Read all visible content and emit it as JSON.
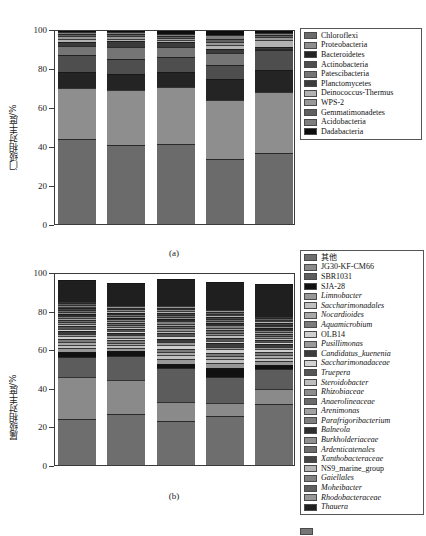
{
  "figure": {
    "panels": [
      "(a)",
      "(b)"
    ]
  },
  "chart_data": [
    {
      "type": "bar",
      "id": "panel-a",
      "stacked": true,
      "percent": true,
      "title": "",
      "caption": "(a)",
      "xlabel": "",
      "ylabel": "门级相对丰度/%",
      "ylim": [
        0,
        100
      ],
      "yticks": [
        0,
        20,
        40,
        60,
        80,
        100
      ],
      "ytick_labels": [
        "0",
        "20",
        "40",
        "60",
        "80",
        "100"
      ],
      "grid": false,
      "legend_position": "right",
      "categories": [
        "UASB-0",
        "UASB-1",
        "UASB-2",
        "UASB-3",
        "UASB-4"
      ],
      "series": [
        {
          "name": "Chloroflexi",
          "color": "#6b6b6b",
          "values": [
            43.8,
            40.6,
            41.0,
            33.5,
            36.2
          ]
        },
        {
          "name": "Proteobacteria",
          "color": "#8e8e8e",
          "values": [
            25.9,
            27.9,
            29.3,
            29.9,
            31.7
          ]
        },
        {
          "name": "Bacteroidetes",
          "color": "#242424",
          "values": [
            8.1,
            8.6,
            7.6,
            11.0,
            11.3
          ]
        },
        {
          "name": "Actinobacteria",
          "color": "#4e4e4e",
          "values": [
            9.0,
            7.6,
            8.0,
            7.2,
            9.8
          ]
        },
        {
          "name": "Patescibacteria",
          "color": "#757575",
          "values": [
            4.4,
            6.3,
            5.1,
            6.2,
            0.6
          ]
        },
        {
          "name": "Planctomycetes",
          "color": "#3b3b3b",
          "values": [
            2.3,
            2.7,
            2.1,
            2.1,
            1.4
          ]
        },
        {
          "name": "Deinococcus-Thermus",
          "color": "#b2b2b2",
          "values": [
            1.5,
            1.4,
            1.3,
            2.0,
            3.6
          ]
        },
        {
          "name": "WPS-2",
          "color": "#989898",
          "values": [
            1.2,
            1.1,
            1.0,
            1.5,
            1.1
          ]
        },
        {
          "name": "Gemmatimonadetes",
          "color": "#606060",
          "values": [
            1.1,
            1.0,
            1.1,
            1.3,
            1.2
          ]
        },
        {
          "name": "Acidobacteria",
          "color": "#7e7e7e",
          "values": [
            1.2,
            1.2,
            1.2,
            2.0,
            1.1
          ]
        },
        {
          "name": "Dadabacteria",
          "color": "#0d0d0d",
          "values": [
            1.5,
            1.6,
            2.3,
            3.3,
            2.0
          ]
        }
      ]
    },
    {
      "type": "bar",
      "id": "panel-b",
      "stacked": true,
      "percent": true,
      "title": "",
      "caption": "(b)",
      "xlabel": "",
      "ylabel": "属级相对丰度/%",
      "ylim": [
        0,
        100
      ],
      "yticks": [
        0,
        20,
        40,
        60,
        80,
        100
      ],
      "ytick_labels": [
        "0",
        "20",
        "40",
        "60",
        "80",
        "100"
      ],
      "grid": false,
      "legend_position": "right",
      "categories": [
        "UASB-0",
        "UASB-1",
        "UASB-2",
        "UASB-3",
        "UASB-4"
      ],
      "series": [
        {
          "name": "其他",
          "color": "#6e6e6e",
          "cjk": true,
          "values": [
            24.0,
            26.5,
            23.0,
            25.5,
            31.5
          ]
        },
        {
          "name": "JG30-KF-CM66",
          "color": "#8a8a8a",
          "values": [
            21.5,
            17.8,
            9.5,
            6.5,
            8.0
          ]
        },
        {
          "name": "SBR1031",
          "color": "#5c5c5c",
          "values": [
            10.5,
            12.0,
            18.0,
            13.5,
            10.5
          ]
        },
        {
          "name": "SJA-28",
          "color": "#111111",
          "values": [
            2.5,
            2.8,
            2.0,
            5.0,
            2.0
          ]
        },
        {
          "name": "Limnobacter",
          "color": "#979797",
          "italic": true,
          "values": [
            2.0,
            1.6,
            2.5,
            2.2,
            2.0
          ]
        },
        {
          "name": "Saccharimonadales",
          "color": "#c0c0c0",
          "italic": true,
          "values": [
            1.6,
            1.3,
            1.9,
            2.0,
            1.6
          ]
        },
        {
          "name": "Nocardioides",
          "color": "#a8a8a8",
          "italic": true,
          "values": [
            1.5,
            1.2,
            1.6,
            1.8,
            1.5
          ]
        },
        {
          "name": "Aquamicrobium",
          "color": "#7b7b7b",
          "italic": true,
          "values": [
            1.5,
            1.4,
            1.8,
            1.5,
            1.4
          ]
        },
        {
          "name": "OLB14",
          "color": "#cfcfcf",
          "values": [
            1.6,
            1.4,
            2.0,
            1.9,
            1.5
          ]
        },
        {
          "name": "Pusillimonas",
          "color": "#999999",
          "italic": true,
          "values": [
            1.4,
            1.3,
            1.6,
            1.5,
            1.3
          ]
        },
        {
          "name": "Candidatus_kuenenia",
          "color": "#3c3c3c",
          "italic": true,
          "values": [
            1.3,
            1.2,
            1.5,
            1.6,
            1.2
          ]
        },
        {
          "name": "Saccharimonadaceae",
          "color": "#d2d2d2",
          "italic": true,
          "values": [
            1.3,
            1.1,
            1.5,
            1.5,
            1.1
          ]
        },
        {
          "name": "Truepera",
          "color": "#555555",
          "italic": true,
          "values": [
            1.2,
            1.1,
            1.4,
            1.4,
            1.2
          ]
        },
        {
          "name": "Steroidobacter",
          "color": "#bebebe",
          "italic": true,
          "values": [
            1.2,
            1.0,
            1.3,
            1.4,
            1.1
          ]
        },
        {
          "name": "Rhizobiaceae",
          "color": "#8d8d8d",
          "italic": true,
          "values": [
            1.1,
            1.0,
            1.3,
            1.3,
            1.1
          ]
        },
        {
          "name": "Anaerolineaceae",
          "color": "#6a6a6a",
          "italic": true,
          "values": [
            1.1,
            1.0,
            1.2,
            1.3,
            1.0
          ]
        },
        {
          "name": "Arenimonas",
          "color": "#a2a2a2",
          "italic": true,
          "values": [
            1.0,
            0.9,
            1.2,
            1.2,
            1.0
          ]
        },
        {
          "name": "Parafrigoribacterium",
          "color": "#7f7f7f",
          "italic": true,
          "values": [
            1.0,
            0.9,
            1.1,
            1.2,
            1.0
          ]
        },
        {
          "name": "Balneola",
          "color": "#2e2e2e",
          "italic": true,
          "values": [
            1.0,
            0.9,
            1.1,
            1.1,
            0.9
          ]
        },
        {
          "name": "Burkholderiaceae",
          "color": "#909090",
          "italic": true,
          "values": [
            1.0,
            0.9,
            1.1,
            1.1,
            0.9
          ]
        },
        {
          "name": "Ardenticatenales",
          "color": "#6d6d6d",
          "italic": true,
          "values": [
            0.9,
            0.9,
            1.0,
            1.0,
            0.9
          ]
        },
        {
          "name": "Xanthobacteraceae",
          "color": "#454545",
          "italic": true,
          "values": [
            0.9,
            0.8,
            1.0,
            1.0,
            0.9
          ]
        },
        {
          "name": "NS9_marine_group",
          "color": "#b5b5b5",
          "values": [
            0.9,
            0.8,
            1.0,
            1.0,
            0.9
          ]
        },
        {
          "name": "Gaiellales",
          "color": "#828282",
          "italic": true,
          "values": [
            0.9,
            0.8,
            1.0,
            1.0,
            0.8
          ]
        },
        {
          "name": "Moheibacter",
          "color": "#5f5f5f",
          "italic": true,
          "values": [
            0.9,
            0.8,
            1.0,
            1.0,
            0.8
          ]
        },
        {
          "name": "Rhodobacteraceae",
          "color": "#989898",
          "italic": true,
          "values": [
            0.9,
            0.8,
            1.0,
            1.0,
            0.8
          ]
        },
        {
          "name": "Thauera",
          "color": "#1f1f1f",
          "italic": true,
          "values": [
            11.3,
            12.0,
            13.8,
            14.3,
            17.1
          ]
        }
      ]
    }
  ],
  "bottom_fragment": {
    "visible": true,
    "color": "#777777"
  }
}
